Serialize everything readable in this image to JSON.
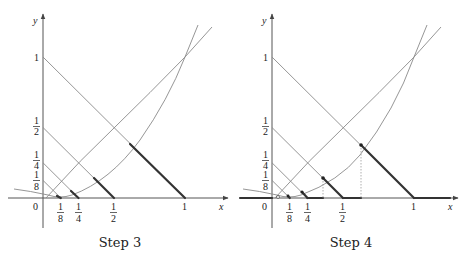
{
  "panels": [
    {
      "caption": "Step 3",
      "x_axis_label": "x",
      "y_axis_label": "y",
      "origin_label": "0",
      "x_ticks": [
        {
          "num": "1",
          "den": "8",
          "value": 0.125
        },
        {
          "num": "1",
          "den": "4",
          "value": 0.25
        },
        {
          "num": "1",
          "den": "2",
          "value": 0.5
        },
        {
          "label": "1",
          "value": 1
        }
      ],
      "y_ticks": [
        {
          "label": "1",
          "value": 1
        },
        {
          "num": "1",
          "den": "2",
          "value": 0.5
        },
        {
          "num": "1",
          "den": "4",
          "value": 0.25
        },
        {
          "num": "1",
          "den": "8",
          "value": 0.125
        }
      ],
      "show_points": false,
      "show_projections": false
    },
    {
      "caption": "Step 4",
      "x_axis_label": "x",
      "y_axis_label": "y",
      "origin_label": "0",
      "x_ticks": [
        {
          "num": "1",
          "den": "8",
          "value": 0.125
        },
        {
          "num": "1",
          "den": "4",
          "value": 0.25
        },
        {
          "num": "1",
          "den": "2",
          "value": 0.5
        },
        {
          "label": "1",
          "value": 1
        }
      ],
      "y_ticks": [
        {
          "label": "1",
          "value": 1
        },
        {
          "num": "1",
          "den": "2",
          "value": 0.5
        },
        {
          "num": "1",
          "den": "4",
          "value": 0.25
        },
        {
          "num": "1",
          "den": "8",
          "value": 0.125
        }
      ],
      "show_points": true,
      "show_projections": true
    }
  ],
  "diagonal_lines": [
    {
      "equation": "x + y = 1",
      "c": 1
    },
    {
      "equation": "x + y = 1/2",
      "c": 0.5
    },
    {
      "equation": "x + y = 1/4",
      "c": 0.25
    },
    {
      "equation": "x + y = 1/8",
      "c": 0.125
    }
  ],
  "curves": [
    {
      "name": "steep-parabola",
      "passes_through": [
        1,
        1
      ]
    },
    {
      "name": "shallow-curve",
      "passes_through": [
        1,
        1
      ]
    }
  ]
}
